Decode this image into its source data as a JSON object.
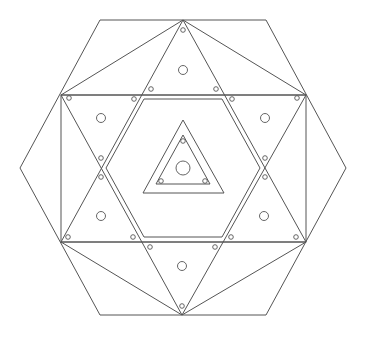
{
  "diagram": {
    "stroke_color": "#555555",
    "background": "#ffffff",
    "outer_hexagon": [
      [
        20,
        168
      ],
      [
        100,
        20
      ],
      [
        266,
        20
      ],
      [
        346,
        168
      ],
      [
        266,
        315
      ],
      [
        100,
        315
      ]
    ],
    "top_fan": [
      [
        [
          183,
          20
        ],
        [
          61,
          95
        ]
      ],
      [
        [
          183,
          20
        ],
        [
          306,
          95
        ]
      ]
    ],
    "bottom_fan": [
      [
        [
          182,
          315
        ],
        [
          61,
          242
        ]
      ],
      [
        [
          182,
          315
        ],
        [
          306,
          242
        ]
      ]
    ],
    "rectangle": {
      "x": 61,
      "y": 95,
      "width": 245,
      "height": 147
    },
    "triangle_up": [
      [
        183,
        20
      ],
      [
        61,
        242
      ],
      [
        306,
        242
      ]
    ],
    "triangle_down": [
      [
        182,
        315
      ],
      [
        61,
        95
      ],
      [
        306,
        95
      ]
    ],
    "inner_hexagon": [
      [
        106,
        168
      ],
      [
        144,
        99
      ],
      [
        222,
        99
      ],
      [
        260,
        168
      ],
      [
        222,
        237
      ],
      [
        144,
        237
      ]
    ],
    "center_triangle_outer": [
      [
        183,
        120
      ],
      [
        143,
        193
      ],
      [
        224,
        193
      ]
    ],
    "center_triangle_inner": [
      [
        183,
        135
      ],
      [
        156,
        184
      ],
      [
        210,
        184
      ]
    ],
    "large_circles": [
      {
        "cx": 183,
        "cy": 70,
        "r": 4.5
      },
      {
        "cx": 101,
        "cy": 118,
        "r": 4.5
      },
      {
        "cx": 265,
        "cy": 118,
        "r": 4.5
      },
      {
        "cx": 101,
        "cy": 216,
        "r": 4.5
      },
      {
        "cx": 264,
        "cy": 216,
        "r": 4.5
      },
      {
        "cx": 182,
        "cy": 266,
        "r": 4.5
      },
      {
        "cx": 183,
        "cy": 168,
        "r": 7
      }
    ],
    "small_circles": [
      {
        "cx": 183,
        "cy": 30
      },
      {
        "cx": 151,
        "cy": 89
      },
      {
        "cx": 216,
        "cy": 89
      },
      {
        "cx": 69,
        "cy": 98
      },
      {
        "cx": 134,
        "cy": 99
      },
      {
        "cx": 232,
        "cy": 99
      },
      {
        "cx": 297,
        "cy": 98
      },
      {
        "cx": 101,
        "cy": 158
      },
      {
        "cx": 101,
        "cy": 177
      },
      {
        "cx": 265,
        "cy": 158
      },
      {
        "cx": 265,
        "cy": 177
      },
      {
        "cx": 68,
        "cy": 237
      },
      {
        "cx": 133,
        "cy": 237
      },
      {
        "cx": 231,
        "cy": 237
      },
      {
        "cx": 296,
        "cy": 237
      },
      {
        "cx": 150,
        "cy": 247
      },
      {
        "cx": 215,
        "cy": 247
      },
      {
        "cx": 182,
        "cy": 306
      },
      {
        "cx": 183,
        "cy": 141
      },
      {
        "cx": 161,
        "cy": 181
      },
      {
        "cx": 205,
        "cy": 181
      }
    ]
  }
}
